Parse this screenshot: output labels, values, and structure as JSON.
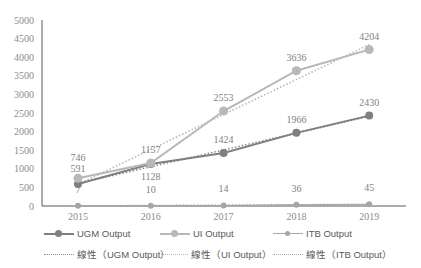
{
  "chart_data": {
    "type": "line",
    "title": "",
    "xlabel": "",
    "ylabel": "",
    "ylim": [
      0,
      5000
    ],
    "yticks": [
      "0",
      "500",
      "1000",
      "1500",
      "2000",
      "2500",
      "3000",
      "3500",
      "4000",
      "4500",
      "5000"
    ],
    "categories": [
      "2015",
      "2016",
      "2017",
      "2018",
      "2019"
    ],
    "grid": false,
    "legend_position": "bottom",
    "series": [
      {
        "name": "UGM Output",
        "values": [
          591,
          1128,
          1424,
          1966,
          2430
        ],
        "color": "#7f7f7f",
        "labels": [
          "591",
          "1128",
          "1424",
          "1966",
          "2430"
        ]
      },
      {
        "name": "UI Output",
        "values": [
          746,
          1157,
          2553,
          3636,
          4204
        ],
        "color": "#b0b0b0",
        "labels": [
          "746",
          "1157",
          "2553",
          "3636",
          "4204"
        ]
      },
      {
        "name": "ITB Output",
        "values": [
          7,
          10,
          14,
          36,
          45
        ],
        "color": "#9a9a9a",
        "labels": [
          "7",
          "10",
          "14",
          "36",
          "45"
        ]
      }
    ],
    "trendlines": [
      {
        "name": "線性（UGM Output）",
        "type": "linear",
        "color": "#7f7f7f"
      },
      {
        "name": "線性（UI Output）",
        "type": "linear",
        "color": "#b0b0b0"
      },
      {
        "name": "線性（ITB Output）",
        "type": "linear",
        "color": "#9a9a9a"
      }
    ]
  },
  "legend": {
    "row1": [
      "UGM Output",
      "UI Output",
      "ITB Output"
    ],
    "row2": [
      "線性（UGM Output）",
      "線性（UI Output）",
      "線性（ITB Output）"
    ]
  }
}
